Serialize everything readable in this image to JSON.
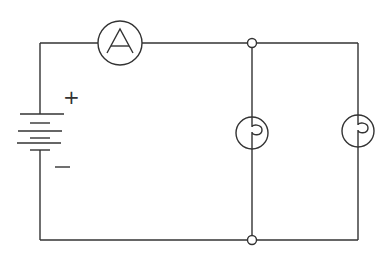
{
  "diagram": {
    "type": "circuit",
    "components": {
      "battery": {
        "positive_label": "+",
        "negative_label": "−"
      },
      "ammeter": {
        "label": "A"
      },
      "lamps": [
        {
          "name": "lamp-1"
        },
        {
          "name": "lamp-2"
        }
      ],
      "junctions": [
        {
          "name": "top-node"
        },
        {
          "name": "bottom-node"
        }
      ]
    },
    "colors": {
      "line": "#333333",
      "background": "#ffffff"
    }
  }
}
